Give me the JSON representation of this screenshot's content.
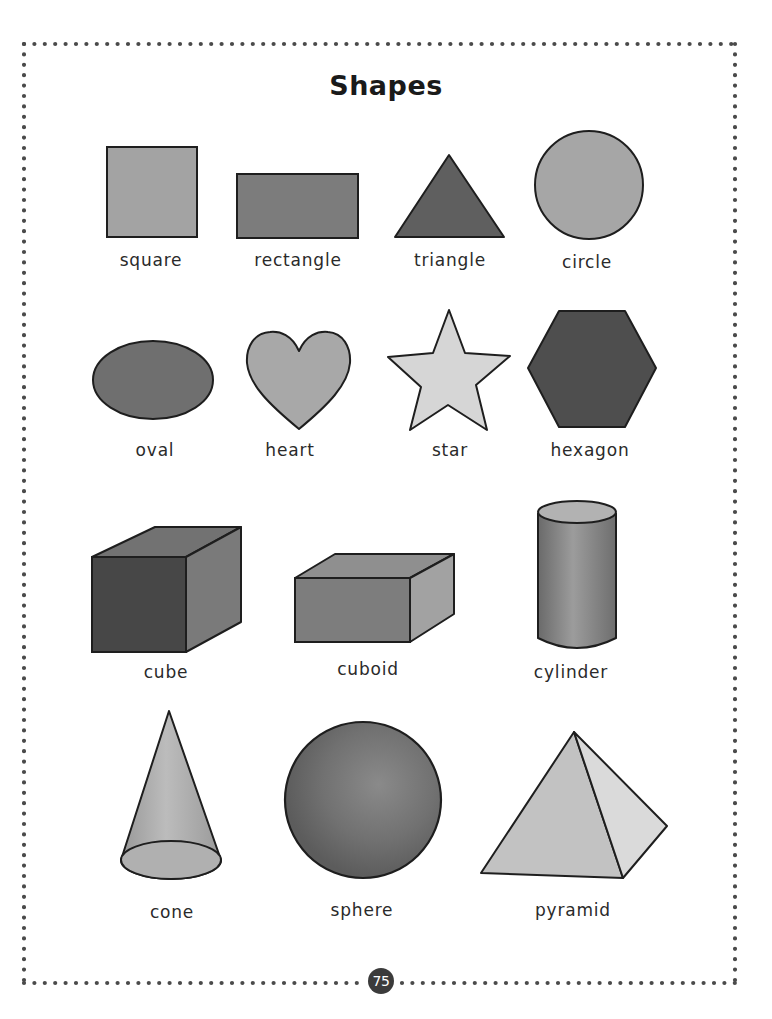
{
  "title": "Shapes",
  "page_number": "75",
  "colors": {
    "border_dot": "#4a4a4a",
    "outline": "#1e1e1e",
    "light_gray": "#d6d6d6",
    "mid_gray": "#9a9a9a",
    "dark_gray": "#6e6e6e",
    "darkest_gray": "#4e4e4e"
  },
  "rows": [
    {
      "shapes": [
        {
          "name": "square",
          "label": "square"
        },
        {
          "name": "rectangle",
          "label": "rectangle"
        },
        {
          "name": "triangle",
          "label": "triangle"
        },
        {
          "name": "circle",
          "label": "circle"
        }
      ]
    },
    {
      "shapes": [
        {
          "name": "oval",
          "label": "oval"
        },
        {
          "name": "heart",
          "label": "heart"
        },
        {
          "name": "star",
          "label": "star"
        },
        {
          "name": "hexagon",
          "label": "hexagon"
        }
      ]
    },
    {
      "shapes": [
        {
          "name": "cube",
          "label": "cube"
        },
        {
          "name": "cuboid",
          "label": "cuboid"
        },
        {
          "name": "cylinder",
          "label": "cylinder"
        }
      ]
    },
    {
      "shapes": [
        {
          "name": "cone",
          "label": "cone"
        },
        {
          "name": "sphere",
          "label": "sphere"
        },
        {
          "name": "pyramid",
          "label": "pyramid"
        }
      ]
    }
  ]
}
